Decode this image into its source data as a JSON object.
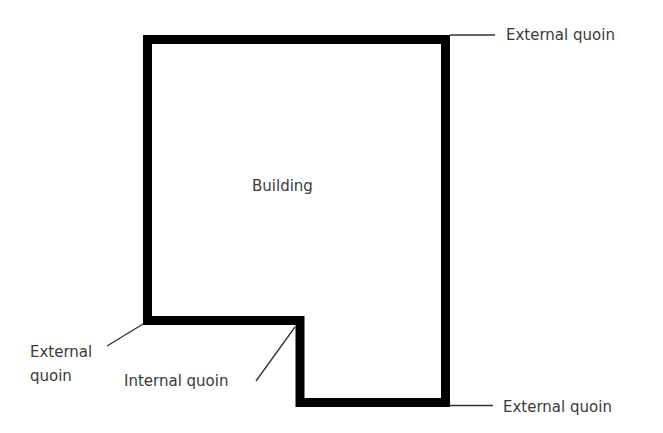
{
  "diagram": {
    "building_label": "Building",
    "labels": {
      "top_right": "External quoin",
      "bottom_left_line1": "External",
      "bottom_left_line2": "quoin",
      "internal": "Internal quoin",
      "bottom_right": "External quoin"
    },
    "colors": {
      "outline": "#000000",
      "text": "#3a3a3a",
      "leader": "#333333"
    }
  }
}
